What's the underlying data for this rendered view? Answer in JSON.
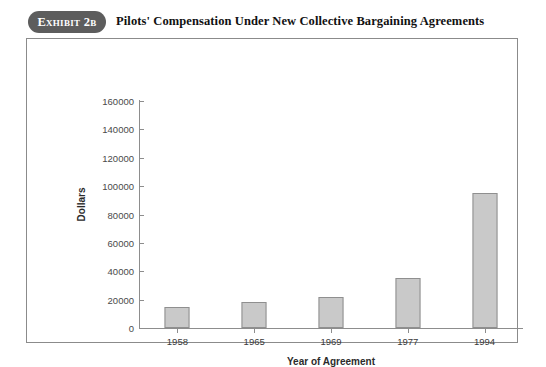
{
  "exhibit": {
    "badge_label": "Exhibit 2b",
    "title": "Pilots' Compensation Under New Collective Bargaining Agreements"
  },
  "chart_data": {
    "type": "bar",
    "title": "Pilots' Compensation Under New Collective Bargaining Agreements",
    "categories": [
      "1958",
      "1965",
      "1969",
      "1977",
      "1994"
    ],
    "values": [
      15000,
      18000,
      22000,
      35500,
      95000
    ],
    "xlabel": "Year of Agreement",
    "ylabel": "Dollars",
    "ylim": [
      0,
      160000
    ],
    "ytick_labels": [
      "0",
      "20000",
      "40000",
      "60000",
      "80000",
      "100000",
      "120000",
      "140000",
      "160000"
    ],
    "ytick_values": [
      0,
      20000,
      40000,
      60000,
      80000,
      100000,
      120000,
      140000,
      160000
    ],
    "grid": false,
    "legend": null,
    "bar_color": "#c9c9c9",
    "bar_border_color": "#8f8f8f",
    "axis_color": "#8d8d8d"
  }
}
